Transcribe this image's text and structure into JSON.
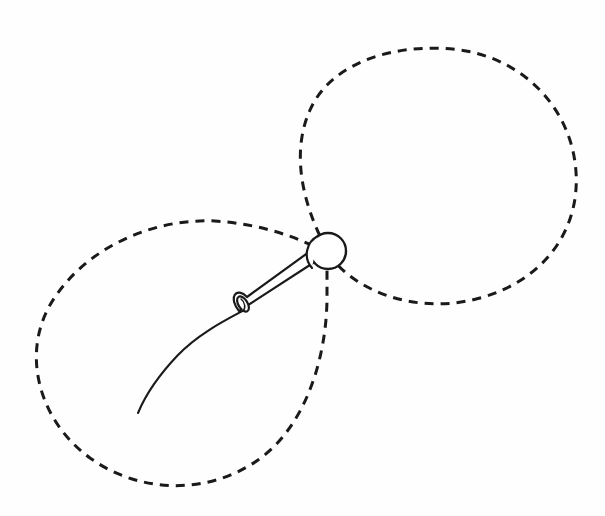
{
  "figure": {
    "title": "Needle and thread forming two dashed stitch loops",
    "background_color": "#fefefe",
    "ink_color": "#1a1a1a",
    "canvas": {
      "width": 605,
      "height": 516
    }
  },
  "elements": {
    "upper_loop": {
      "name": "upper-right-dashed-loop",
      "style": "dashed",
      "stroke_color": "#1a1a1a",
      "stroke_width": 3.0,
      "dash_length": 9,
      "dash_gap": 7,
      "bounds": {
        "left": 296,
        "top": 47,
        "right": 578,
        "bottom": 308
      },
      "path": "M 327 250 C 300 200 292 150 310 110 C 332 60 400 42 460 50 C 525 59 572 110 576 172 C 580 232 542 281 480 298 C 430 312 378 300 345 272 C 338 266 332 259 327 250 Z"
    },
    "lower_loop": {
      "name": "lower-left-dashed-loop",
      "style": "dashed",
      "stroke_color": "#1a1a1a",
      "stroke_width": 3.0,
      "dash_length": 9,
      "dash_gap": 7,
      "bounds": {
        "left": 36,
        "top": 220,
        "right": 334,
        "bottom": 489
      },
      "path": "M 327 253 C 300 238 262 224 215 221 C 150 218 82 250 50 305 C 22 354 38 420 90 458 C 140 494 208 495 258 460 C 305 427 326 360 327 300 C 327 282 327 266 327 253 Z"
    },
    "needle": {
      "name": "sewing-needle",
      "stroke_color": "#1a1a1a",
      "stroke_width": 2.2,
      "fill_color": "#ffffff",
      "head": {
        "name": "needle-head",
        "shape": "circle",
        "center_x": 328,
        "center_y": 251,
        "radius": 18
      },
      "shaft": {
        "name": "needle-shaft",
        "from_x": 318,
        "from_y": 260,
        "to_x": 246,
        "to_y": 305,
        "width_at_head": 14,
        "width_at_tip": 9
      },
      "eye": {
        "name": "needle-eye-ferrule",
        "shape": "ellipse",
        "center_x": 243,
        "center_y": 304,
        "rx": 4.5,
        "ry": 8,
        "rotation_deg": -32
      }
    },
    "thread": {
      "name": "thread-tail",
      "style": "solid",
      "stroke_color": "#1a1a1a",
      "stroke_width": 2.0,
      "start_x": 243,
      "start_y": 307,
      "end_x": 138,
      "end_y": 413,
      "path": "M 248 308 C 230 318 200 332 178 355 C 158 376 145 396 138 413"
    }
  }
}
